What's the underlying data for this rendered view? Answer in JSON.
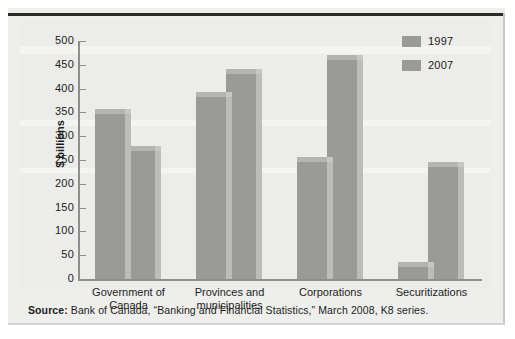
{
  "chart_data": {
    "type": "bar",
    "title": "",
    "subtitle": "",
    "xlabel": "",
    "ylabel": "$ billions",
    "ylim": [
      0,
      500
    ],
    "ytick_step": 50,
    "yticks": [
      500,
      450,
      400,
      350,
      300,
      250,
      200,
      150,
      100,
      50,
      0
    ],
    "grid": false,
    "legend_position": "top-right",
    "categories": [
      "Government of Canada",
      "Provinces and municipalities",
      "Corporations",
      "Securitizations"
    ],
    "category_lines": [
      [
        "Government of",
        "Canada"
      ],
      [
        "Provinces and",
        "municipalities"
      ],
      [
        "Corporations"
      ],
      [
        "Securitizations"
      ]
    ],
    "series": [
      {
        "name": "1997",
        "values": [
          347,
          383,
          245,
          25
        ]
      },
      {
        "name": "2007",
        "values": [
          268,
          430,
          460,
          235
        ]
      }
    ],
    "bar_color": "#9a9a96",
    "bar_side_color": "#bcbcb8",
    "bar_top_color": "#b4b4b0",
    "panel_color": "#ececea",
    "axis_color": "#8e8e8a"
  },
  "legend": {
    "items": [
      {
        "label": "1997",
        "color": "#9a9a96"
      },
      {
        "label": "2007",
        "color": "#9a9a96"
      }
    ]
  },
  "source": {
    "label": "Source:",
    "text": " Bank of Canada, “Banking and Financial Statistics,” March 2008, K8 series."
  }
}
